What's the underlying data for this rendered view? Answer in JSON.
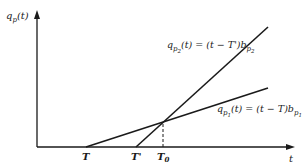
{
  "diagram": {
    "y_axis_label": "q",
    "y_axis_label_sub": "p",
    "y_axis_label_arg": "(t)",
    "x_axis_label": "t",
    "ticks": {
      "T": "T",
      "T_prime": "T'",
      "T0_main": "T",
      "T0_sub": "0"
    },
    "line_p2": {
      "q": "q",
      "sub": "p",
      "subsub": "2",
      "expr": "(t) = (t − T')b",
      "b_sub": "p",
      "b_subsub": "2"
    },
    "line_p1": {
      "q": "q",
      "sub": "p",
      "subsub": "1",
      "expr": "(t) = (t − T)b",
      "b_sub": "p",
      "b_subsub": "1"
    },
    "colors": {
      "line": "#1a1a1a",
      "background": "#ffffff"
    }
  }
}
